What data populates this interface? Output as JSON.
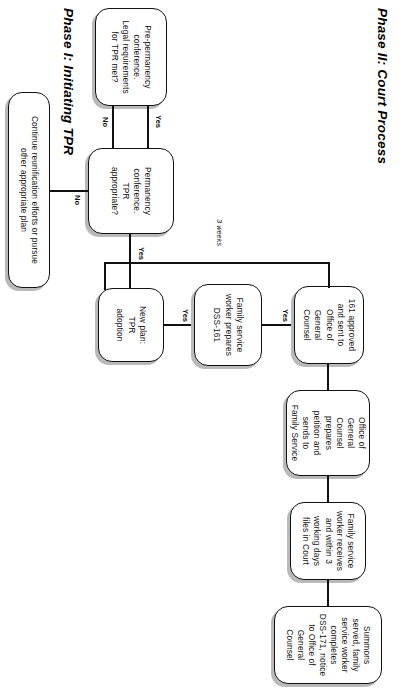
{
  "document": {
    "title": "Termination of Parental Rights (TPR) Process Flowchart",
    "orientation": "landscape-rotated"
  },
  "phases": [
    {
      "id": "phase-1",
      "title": "Phase I: Initiating TPR"
    },
    {
      "id": "phase-2",
      "title": "Phase II: Court Process"
    }
  ],
  "nodes": {
    "pre_permanency": {
      "lines": [
        "Pre-permanency",
        "conference.",
        "Legal requirements",
        "for TPR met?"
      ]
    },
    "permanency": {
      "lines": [
        "Permanency",
        "conference.",
        "TPR",
        "appropriate?"
      ]
    },
    "continue_reunification": {
      "lines": [
        "Continue reunification efforts or pursue",
        "other appropriate plan"
      ]
    },
    "new_plan": {
      "lines": [
        "New plan:",
        "TPR",
        "adoption"
      ]
    },
    "prepares_161": {
      "lines": [
        "Family service",
        "worker prepares",
        "DSS-161"
      ]
    },
    "approved_161": {
      "lines": [
        "161 approved",
        "and sent to",
        "Office of",
        "General",
        "Counsel"
      ]
    },
    "ogc_petition": {
      "lines": [
        "Office of",
        "General",
        "Counsel",
        "prepares",
        "petition and",
        "sends to",
        "Family Service"
      ]
    },
    "files_in_court": {
      "lines": [
        "Family service",
        "worker receives",
        "and within 3",
        "working days",
        "files in Court"
      ]
    },
    "summons": {
      "lines": [
        "Summons",
        "served, family",
        "service worker",
        "completes",
        "DSS-171, notice",
        "to Office of",
        "General",
        "Counsel"
      ]
    }
  },
  "edge_labels": {
    "pre_to_perm_yes": "Yes",
    "perm_no": "No",
    "perm_to_newplan_yes": "Yes",
    "newplan_to_161_yes": "Yes",
    "prep161_to_approved_yes": "Yes",
    "bracket_duration": "3 weeks"
  },
  "colors": {
    "ink": "#111111",
    "shadow": "#b9b9b9",
    "paper": "#ffffff"
  }
}
